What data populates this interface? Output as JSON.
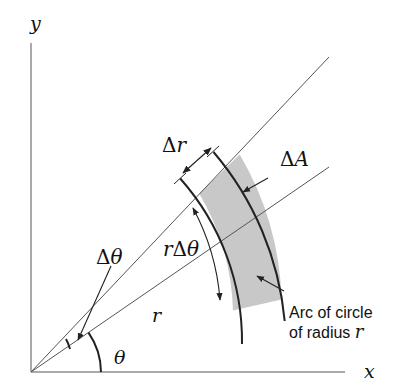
{
  "diagram": {
    "type": "polar-area-element",
    "axes": {
      "x_label": "x",
      "y_label": "y"
    },
    "labels": {
      "delta": "Δ",
      "delta_r_var": "r",
      "delta_A_var": "A",
      "r_delta_theta_r": "r",
      "r_delta_theta_delta": "Δ",
      "r_delta_theta_theta": "θ",
      "delta_theta_delta": "Δ",
      "delta_theta_theta": "θ",
      "radius": "r",
      "theta": "θ",
      "arc_note_line1": "Arc of circle",
      "arc_note_line2_text": "of radius ",
      "arc_note_line2_var": "r"
    },
    "colors": {
      "shade": "#c8c8c8",
      "line": "#333333",
      "stroke_dark": "#222222"
    },
    "geometry": {
      "origin": [
        31,
        372
      ],
      "ray_upper_angle_deg": 46.6,
      "ray_lower_angle_deg": 34.5,
      "inner_radius": 245,
      "outer_radius": 304
    }
  }
}
